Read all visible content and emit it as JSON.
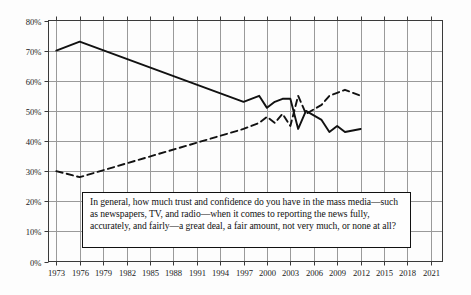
{
  "chart_data": {
    "type": "line",
    "title": "",
    "xlabel": "",
    "ylabel": "",
    "xlim": [
      1972,
      2022.5
    ],
    "ylim": [
      0,
      80
    ],
    "grid": true,
    "legend_position": "none",
    "y_ticks": [
      "0%",
      "10%",
      "20%",
      "30%",
      "40%",
      "50%",
      "60%",
      "70%",
      "80%"
    ],
    "y_tick_values": [
      0,
      10,
      20,
      30,
      40,
      50,
      60,
      70,
      80
    ],
    "x_ticks": [
      "1973",
      "1976",
      "1979",
      "1982",
      "1985",
      "1988",
      "1991",
      "1994",
      "1997",
      "2000",
      "2003",
      "2006",
      "2009",
      "2012",
      "2015",
      "2018",
      "2021"
    ],
    "x_tick_values": [
      1973,
      1976,
      1979,
      1982,
      1985,
      1988,
      1991,
      1994,
      1997,
      2000,
      2003,
      2006,
      2009,
      2012,
      2015,
      2018,
      2021
    ],
    "annotation": "In general, how much trust and confidence do you have in the mass media—such as newspapers, TV, and radio—when it comes to reporting the news fully, accurately, and fairly—a great deal, a fair amount, not very much, or none at all?",
    "series": [
      {
        "name": "Great deal / fair amount",
        "style": "solid",
        "color": "#111111",
        "x": [
          1973,
          1976,
          1997,
          1999,
          2000,
          2001,
          2002,
          2003,
          2004,
          2005,
          2007,
          2008,
          2009,
          2010,
          2012
        ],
        "values": [
          70,
          73,
          53,
          55,
          51,
          53,
          54,
          54,
          44,
          50,
          47,
          43,
          45,
          43,
          44
        ]
      },
      {
        "name": "Not very much / none at all",
        "style": "dashed",
        "color": "#111111",
        "x": [
          1973,
          1976,
          1997,
          1999,
          2000,
          2001,
          2002,
          2003,
          2004,
          2005,
          2007,
          2008,
          2009,
          2010,
          2012
        ],
        "values": [
          30,
          28,
          44,
          46,
          48,
          46,
          49,
          45,
          55,
          49,
          52,
          55,
          56,
          57,
          55
        ]
      }
    ]
  }
}
